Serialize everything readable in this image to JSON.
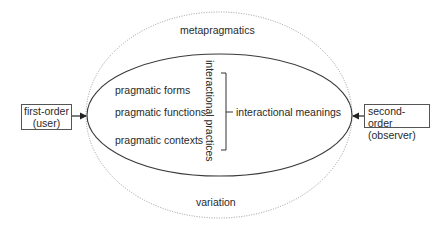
{
  "diagram": {
    "outer_ellipse": {
      "top_label": "metapragmatics",
      "bottom_label": "variation",
      "style": "dotted",
      "color": "#9a9a9a"
    },
    "inner_ellipse": {
      "style": "solid",
      "color": "#3a3a3a",
      "items": [
        {
          "label": "pragmatic forms"
        },
        {
          "label": "pragmatic functions"
        },
        {
          "label": "pragmatic contexts"
        }
      ],
      "bracket_label": "interactional practices",
      "result_label": "interactional meanings"
    },
    "left_box": {
      "line1": "first-order",
      "line2": "(user)"
    },
    "right_box": {
      "line1": "second-order",
      "line2": "(observer)"
    }
  }
}
